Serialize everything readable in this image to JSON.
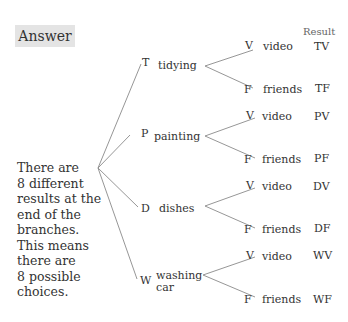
{
  "answer_label": "Answer",
  "result_header": "Result",
  "explanation": "There are 8 different results at the end of the branches. This means there are 8 possible choices.",
  "explanation_lines": [
    "There are",
    "8 different",
    "results at the",
    "end of the",
    "branches.",
    "This means",
    "there are",
    "8 possible",
    "choices."
  ],
  "first_stage": [
    {
      "letter": "T",
      "label": "tidying",
      "label2": ""
    },
    {
      "letter": "P",
      "label": "painting",
      "label2": ""
    },
    {
      "letter": "D",
      "label": "dishes",
      "label2": ""
    },
    {
      "letter": "W",
      "label": "washing",
      "label2": "car"
    }
  ],
  "second_stage": [
    {
      "letter": "V",
      "label": "video",
      "result": "TV"
    },
    {
      "letter": "F",
      "label": "friends",
      "result": "TF"
    },
    {
      "letter": "V",
      "label": "video",
      "result": "PV"
    },
    {
      "letter": "F",
      "label": "friends",
      "result": "PF"
    },
    {
      "letter": "V",
      "label": "video",
      "result": "DV"
    },
    {
      "letter": "F",
      "label": "friends",
      "result": "DF"
    },
    {
      "letter": "V",
      "label": "video",
      "result": "WV"
    },
    {
      "letter": "F",
      "label": "friends",
      "result": "WF"
    }
  ],
  "colors": {
    "line": "#8a8a8a",
    "answer_bg": "#e4e4e4"
  }
}
